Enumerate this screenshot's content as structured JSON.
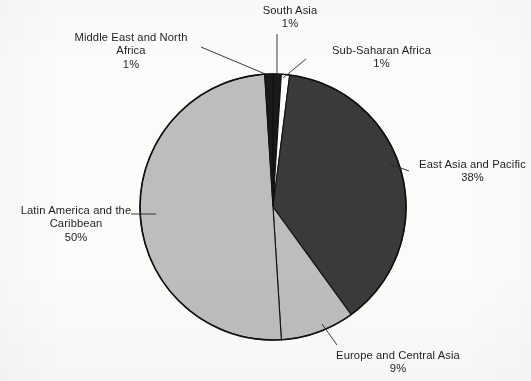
{
  "chart_data": {
    "type": "pie",
    "title": "",
    "subtitle": "",
    "xlabel": "",
    "ylabel": "",
    "legend_position": "none",
    "grid": false,
    "label_format": "name + percent",
    "start_angle_deg": 0,
    "direction": "clockwise",
    "categories": [
      "South Asia",
      "Sub-Saharan Africa",
      "East Asia and Pacific",
      "Europe and Central Asia",
      "Latin America and the Caribbean",
      "Middle East and North Africa"
    ],
    "values": [
      1,
      1,
      38,
      9,
      50,
      1
    ],
    "slices": [
      {
        "name": "South Asia",
        "value": 1,
        "percent_text": "1%",
        "fill": "#1a1a1a",
        "label_lines": [
          "South Asia"
        ],
        "leader": true
      },
      {
        "name": "Sub-Saharan Africa",
        "value": 1,
        "percent_text": "1%",
        "fill": "#fdfdfd",
        "label_lines": [
          "Sub-Saharan Africa"
        ],
        "leader": true
      },
      {
        "name": "East Asia and Pacific",
        "value": 38,
        "percent_text": "38%",
        "fill": "#3a3a3a",
        "label_lines": [
          "East Asia and Pacific"
        ],
        "leader": true
      },
      {
        "name": "Europe and Central Asia",
        "value": 9,
        "percent_text": "9%",
        "fill": "#bdbdbd",
        "label_lines": [
          "Europe and Central Asia"
        ],
        "leader": true
      },
      {
        "name": "Latin America and the Caribbean",
        "value": 50,
        "percent_text": "50%",
        "fill": "#bdbdbd",
        "label_lines": [
          "Latin America and the",
          "Caribbean"
        ],
        "leader": true
      },
      {
        "name": "Middle East and North Africa",
        "value": 1,
        "percent_text": "1%",
        "fill": "#1a1a1a",
        "label_lines": [
          "Middle East and North",
          "Africa"
        ],
        "leader": true
      }
    ]
  },
  "labels": {
    "south_asia": {
      "line1": "South Asia",
      "pct": "1%"
    },
    "mena": {
      "line1": "Middle East and North",
      "line2": "Africa",
      "pct": "1%"
    },
    "ssa": {
      "line1": "Sub-Saharan Africa",
      "pct": "1%"
    },
    "eap": {
      "line1": "East Asia and Pacific",
      "pct": "38%"
    },
    "lac": {
      "line1": "Latin America and the",
      "line2": "Caribbean",
      "pct": "50%"
    },
    "eca": {
      "line1": "Europe and Central Asia",
      "pct": "9%"
    }
  },
  "colors": {
    "background": "#fbfbfa",
    "outline": "#111111",
    "dark_slice": "#3a3a3a",
    "light_slice": "#bdbdbd",
    "black_slice": "#1a1a1a",
    "white_slice": "#fdfdfd",
    "text": "#1f1f1f"
  },
  "geometry": {
    "center_x": 273,
    "center_y": 207,
    "radius": 133
  }
}
